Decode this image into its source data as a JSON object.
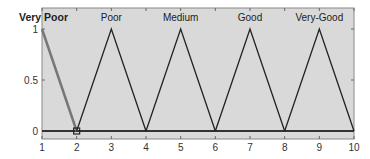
{
  "chart_data": {
    "type": "line",
    "title": "",
    "xlabel": "",
    "ylabel": "",
    "xlim": [
      1,
      10
    ],
    "ylim": [
      0,
      1
    ],
    "x_ticks": [
      "1",
      "2",
      "3",
      "4",
      "5",
      "6",
      "7",
      "8",
      "9",
      "10"
    ],
    "y_ticks": [
      "0",
      "0.5",
      "1"
    ],
    "grid": false,
    "background": "#d9d9d9",
    "series": [
      {
        "name": "Very Poor",
        "x": [
          1,
          2
        ],
        "y": [
          1,
          0
        ],
        "color": "#777777",
        "highlighted": true
      },
      {
        "name": "Poor",
        "x": [
          2,
          3,
          4
        ],
        "y": [
          0,
          1,
          0
        ],
        "color": "#222222"
      },
      {
        "name": "Medium",
        "x": [
          4,
          5,
          6
        ],
        "y": [
          0,
          1,
          0
        ],
        "color": "#222222"
      },
      {
        "name": "Good",
        "x": [
          6,
          7,
          8
        ],
        "y": [
          0,
          1,
          0
        ],
        "color": "#222222"
      },
      {
        "name": "Very-Good",
        "x": [
          8,
          9,
          10
        ],
        "y": [
          0,
          1,
          0
        ],
        "color": "#222222"
      }
    ],
    "labels": [
      {
        "text": "Very Poor",
        "x": 1,
        "bold": true
      },
      {
        "text": "Poor",
        "x": 3
      },
      {
        "text": "Medium",
        "x": 5
      },
      {
        "text": "Good",
        "x": 7
      },
      {
        "text": "Very-Good",
        "x": 9
      }
    ],
    "markers": [
      {
        "x": 2,
        "y": 0,
        "shape": "square"
      }
    ]
  }
}
